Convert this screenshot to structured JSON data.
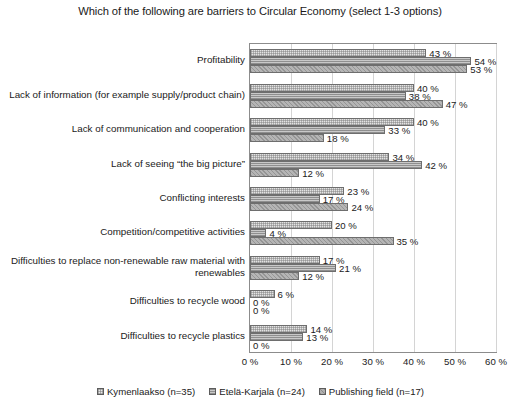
{
  "chart_data": {
    "type": "bar",
    "orientation": "horizontal",
    "title": "Which of the following are barriers to Circular Economy (select 1-3 options)",
    "xlabel": "",
    "ylabel": "",
    "xlim": [
      0,
      60
    ],
    "xtick_labels": [
      "0 %",
      "10 %",
      "20 %",
      "30 %",
      "40 %",
      "50 %",
      "60 %"
    ],
    "xticks": [
      0,
      10,
      20,
      30,
      40,
      50,
      60
    ],
    "grid": true,
    "legend_position": "bottom",
    "value_suffix": " %",
    "categories": [
      "Profitability",
      "Lack of information (for example supply/product chain)",
      "Lack of communication and cooperation",
      "Lack of seeing “the big picture”",
      "Conflicting interests",
      "Competition/competitive activities",
      "Difficulties to replace non-renewable raw material with renewables",
      "Difficulties to recycle wood",
      "Difficulties to recycle plastics"
    ],
    "series": [
      {
        "name": "Kymenlaakso (n=35)",
        "values": [
          43,
          40,
          40,
          34,
          23,
          20,
          17,
          6,
          14
        ],
        "labels": [
          "43 %",
          "40 %",
          "40 %",
          "34 %",
          "23 %",
          "20 %",
          "17 %",
          "6 %",
          "14 %"
        ]
      },
      {
        "name": "Etelä-Karjala (n=24)",
        "values": [
          54,
          38,
          33,
          42,
          17,
          4,
          21,
          0,
          13
        ],
        "labels": [
          "54 %",
          "38 %",
          "33 %",
          "42 %",
          "17 %",
          "4 %",
          "21 %",
          "0 %",
          "13 %"
        ]
      },
      {
        "name": "Publishing field (n=17)",
        "values": [
          53,
          47,
          18,
          12,
          24,
          35,
          12,
          0,
          0
        ],
        "labels": [
          "53 %",
          "47 %",
          "18 %",
          "12 %",
          "24 %",
          "35 %",
          "12 %",
          "0 %",
          "0 %"
        ]
      }
    ],
    "colors": {
      "series_1": "#e3e3e3",
      "series_2": "#c9c9c9",
      "series_3": "#b5b5b5",
      "border": "#6e6e6e",
      "grid": "#d4d4d4",
      "axis": "#8c8c8c",
      "text": "#1a1a1a",
      "background": "#ffffff"
    }
  }
}
